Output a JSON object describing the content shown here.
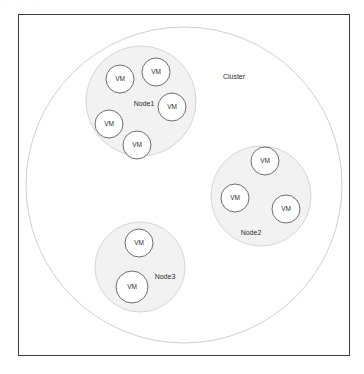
{
  "diagram": {
    "title_artifact": ". . .",
    "frame": {
      "x": 18,
      "y": 14,
      "width": 332,
      "height": 342
    },
    "cluster": {
      "label": "Cluster",
      "cx": 184,
      "cy": 185,
      "r": 158,
      "label_x": 234,
      "label_y": 77,
      "fill": "#ffffff",
      "stroke": "#d0d0d0"
    },
    "node_fill": "#f2f2f2",
    "node_stroke": "#d6d6d6",
    "vm_fill": "#ffffff",
    "vm_stroke": "#6e6e6e",
    "vm_label": "VM",
    "nodes": [
      {
        "label": "Node1",
        "cx": 141,
        "cy": 101,
        "r": 55,
        "label_x": 144,
        "label_y": 104,
        "vms": [
          {
            "label": "VM",
            "cx": 120,
            "cy": 79,
            "r": 14
          },
          {
            "label": "VM",
            "cx": 156,
            "cy": 72,
            "r": 14
          },
          {
            "label": "VM",
            "cx": 172,
            "cy": 107,
            "r": 14
          },
          {
            "label": "VM",
            "cx": 109,
            "cy": 124,
            "r": 14
          },
          {
            "label": "VM",
            "cx": 137,
            "cy": 145,
            "r": 14
          }
        ]
      },
      {
        "label": "Node2",
        "cx": 261,
        "cy": 196,
        "r": 50,
        "label_x": 251,
        "label_y": 233,
        "vms": [
          {
            "label": "VM",
            "cx": 265,
            "cy": 161,
            "r": 14
          },
          {
            "label": "VM",
            "cx": 235,
            "cy": 198,
            "r": 14
          },
          {
            "label": "VM",
            "cx": 286,
            "cy": 209,
            "r": 14
          }
        ]
      },
      {
        "label": "Node3",
        "cx": 140,
        "cy": 267,
        "r": 45,
        "label_x": 165,
        "label_y": 277,
        "vms": [
          {
            "label": "VM",
            "cx": 139,
            "cy": 243,
            "r": 14
          },
          {
            "label": "VM",
            "cx": 132,
            "cy": 287,
            "r": 16
          }
        ]
      }
    ]
  }
}
